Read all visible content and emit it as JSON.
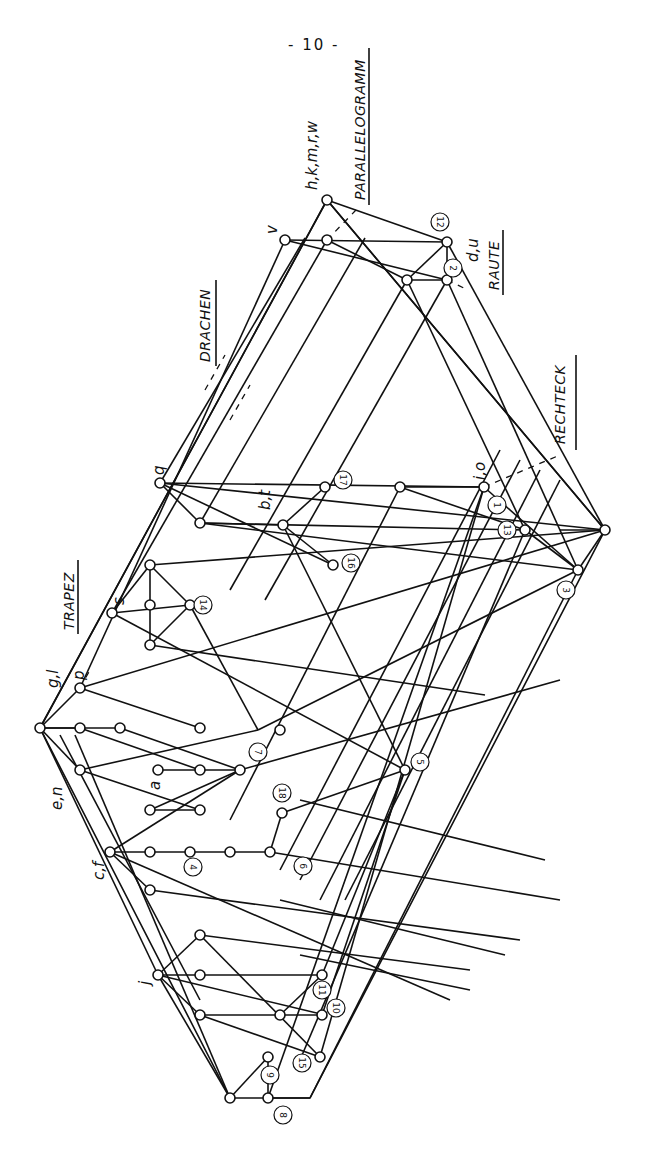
{
  "page": {
    "number_text": "- 10 -"
  },
  "diagram": {
    "classes": [
      {
        "id": "parallelogramm",
        "label": "PARALLELOGRAMM"
      },
      {
        "id": "raute",
        "label": "RAUTE"
      },
      {
        "id": "rechteck",
        "label": "RECHTECK"
      },
      {
        "id": "drachen",
        "label": "DRACHEN"
      },
      {
        "id": "trapez",
        "label": "TRAPEZ"
      }
    ],
    "letter_labels": [
      {
        "id": "hkmrw",
        "text": "h,k,m,r,w"
      },
      {
        "id": "v",
        "text": "v"
      },
      {
        "id": "du",
        "text": "d,u"
      },
      {
        "id": "io",
        "text": "i,o"
      },
      {
        "id": "q",
        "text": "q"
      },
      {
        "id": "bt",
        "text": "b,t"
      },
      {
        "id": "s",
        "text": "s"
      },
      {
        "id": "gl",
        "text": "g,l"
      },
      {
        "id": "p",
        "text": "p"
      },
      {
        "id": "en",
        "text": "e,n"
      },
      {
        "id": "a",
        "text": "a"
      },
      {
        "id": "cf",
        "text": "c,f"
      },
      {
        "id": "j",
        "text": "j"
      }
    ],
    "numbered_nodes": [
      "1",
      "2",
      "3",
      "4",
      "5",
      "6",
      "7",
      "8",
      "9",
      "10",
      "11",
      "12",
      "13",
      "14",
      "15",
      "16",
      "17",
      "18"
    ]
  }
}
